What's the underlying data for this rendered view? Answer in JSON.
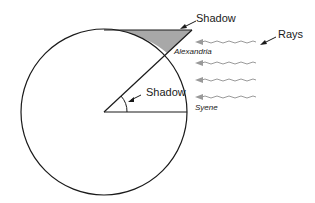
{
  "diagram": {
    "labels": {
      "shadow_top": "Shadow",
      "shadow_angle": "Shadow",
      "rays": "Rays",
      "alexandria": "Alexandria",
      "syene": "Syene"
    },
    "colors": {
      "stroke": "#1a1a1a",
      "shadow_fill": "#a8a8a8",
      "ray": "#9a9a9a"
    },
    "rays_count": 4
  }
}
